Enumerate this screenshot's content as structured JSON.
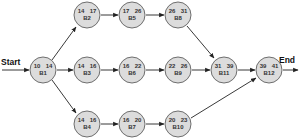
{
  "diagram": {
    "start_label": "Start",
    "end_label": "End",
    "colors": {
      "node_fill": "#dcdcdc",
      "node_stroke": "#6e6e6e",
      "edge": "#222222",
      "text": "#333333"
    },
    "nodes": [
      {
        "id": "B1",
        "es": "10",
        "ef": "14",
        "name": "B1"
      },
      {
        "id": "B2",
        "es": "14",
        "ef": "17",
        "name": "B2"
      },
      {
        "id": "B3",
        "es": "14",
        "ef": "16",
        "name": "B3"
      },
      {
        "id": "B4",
        "es": "14",
        "ef": "16",
        "name": "B4"
      },
      {
        "id": "B5",
        "es": "17",
        "ef": "26",
        "name": "B5"
      },
      {
        "id": "B6",
        "es": "16",
        "ef": "22",
        "name": "B6"
      },
      {
        "id": "B7",
        "es": "16",
        "ef": "20",
        "name": "B7"
      },
      {
        "id": "B8",
        "es": "26",
        "ef": "31",
        "name": "B8"
      },
      {
        "id": "B9",
        "es": "22",
        "ef": "26",
        "name": "B9"
      },
      {
        "id": "B10",
        "es": "20",
        "ef": "23",
        "name": "B10"
      },
      {
        "id": "B11",
        "es": "31",
        "ef": "39",
        "name": "B11"
      },
      {
        "id": "B12",
        "es": "39",
        "ef": "41",
        "name": "B12"
      }
    ],
    "edges": [
      [
        "Start",
        "B1"
      ],
      [
        "B1",
        "B2"
      ],
      [
        "B1",
        "B3"
      ],
      [
        "B1",
        "B4"
      ],
      [
        "B2",
        "B5"
      ],
      [
        "B3",
        "B6"
      ],
      [
        "B4",
        "B7"
      ],
      [
        "B5",
        "B8"
      ],
      [
        "B6",
        "B9"
      ],
      [
        "B7",
        "B10"
      ],
      [
        "B8",
        "B11"
      ],
      [
        "B9",
        "B11"
      ],
      [
        "B11",
        "B12"
      ],
      [
        "B10",
        "B12"
      ],
      [
        "B12",
        "End"
      ]
    ]
  }
}
